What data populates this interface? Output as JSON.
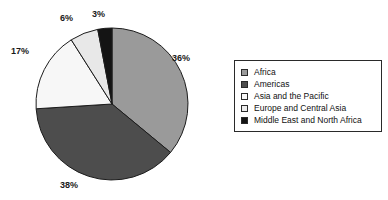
{
  "chart_data": {
    "type": "pie",
    "title": "",
    "subtitle": "",
    "categories": [
      "Africa",
      "Americas",
      "Asia and the Pacific",
      "Europe and Central Asia",
      "Middle East and North Africa"
    ],
    "values": [
      36,
      38,
      17,
      6,
      3
    ],
    "data_labels": [
      "36%",
      "38%",
      "17%",
      "6%",
      "3%"
    ],
    "unit": "%",
    "start_angle_deg": 0,
    "direction": "clockwise",
    "grid": false,
    "legend_position": "right",
    "colors": [
      "#9a9a9a",
      "#4d4d4d",
      "#f7f7f7",
      "#e8e8e8",
      "#141414"
    ],
    "slice_border_color": "#1c1c1c",
    "label_positions": [
      {
        "label": "36%",
        "left": 172,
        "top": 53
      },
      {
        "label": "38%",
        "left": 60,
        "top": 180
      },
      {
        "label": "17%",
        "left": 11,
        "top": 46
      },
      {
        "label": "6%",
        "left": 60,
        "top": 13
      },
      {
        "label": "3%",
        "left": 92,
        "top": 9
      }
    ],
    "xlabel": "",
    "ylabel": ""
  },
  "legend": {
    "items": [
      {
        "label": "Africa",
        "color": "#9a9a9a"
      },
      {
        "label": "Americas",
        "color": "#4d4d4d"
      },
      {
        "label": "Asia and the Pacific",
        "color": "#f7f7f7"
      },
      {
        "label": "Europe and Central Asia",
        "color": "#ececec"
      },
      {
        "label": "Middle East and North Africa",
        "color": "#141414"
      }
    ]
  }
}
